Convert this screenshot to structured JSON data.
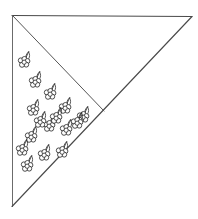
{
  "figure": {
    "caption": "",
    "background_color": "#ffffff",
    "line_color": "#4a4a4a",
    "motif_line_color": "#2e2e2e",
    "canvas": {
      "width": 198,
      "height": 219
    }
  },
  "shapes": {
    "outer_triangle": {
      "name": "outer-triangle",
      "label": "outer triangle outline",
      "points": "12,15 192,16 12,207",
      "vertices": [
        {
          "name": "top-left-corner",
          "x": 12,
          "y": 15
        },
        {
          "name": "top-right-corner",
          "x": 192,
          "y": 16
        },
        {
          "name": "bottom-left-corner",
          "x": 12,
          "y": 207
        }
      ]
    },
    "top_edge": {
      "name": "top-edge",
      "label": "top horizontal edge",
      "x1": 12,
      "y1": 15,
      "x2": 192,
      "y2": 16
    },
    "left_edge": {
      "name": "left-edge",
      "label": "left vertical edge",
      "x1": 12,
      "y1": 15,
      "x2": 12,
      "y2": 207
    },
    "hypotenuse": {
      "name": "hypotenuse-edge",
      "label": "diagonal hypotenuse from top right to bottom left",
      "x1": 192,
      "y1": 16,
      "x2": 12,
      "y2": 207
    },
    "fold_line": {
      "name": "fold-line",
      "label": "interior fold line from top-left corner to hypotenuse",
      "x1": 12,
      "y1": 15,
      "x2": 104,
      "y2": 111
    }
  },
  "motifs": {
    "name": "floral-sprig-motifs",
    "label": "floral sprig cluster motifs",
    "count": 16,
    "petal_radius": 2.5,
    "items": [
      {
        "id": 1,
        "x": 24,
        "y": 62,
        "petals": 5,
        "stem": true
      },
      {
        "id": 2,
        "x": 35,
        "y": 82,
        "petals": 5,
        "stem": true
      },
      {
        "id": 3,
        "x": 50,
        "y": 93,
        "petals": 5,
        "stem": true
      },
      {
        "id": 4,
        "x": 33,
        "y": 110,
        "petals": 5,
        "stem": true
      },
      {
        "id": 5,
        "x": 65,
        "y": 108,
        "petals": 5,
        "stem": true
      },
      {
        "id": 6,
        "x": 82,
        "y": 117,
        "petals": 5,
        "stem": true
      },
      {
        "id": 7,
        "x": 49,
        "y": 126,
        "petals": 5,
        "stem": true
      },
      {
        "id": 8,
        "x": 66,
        "y": 135,
        "petals": 5,
        "stem": true
      },
      {
        "id": 9,
        "x": 31,
        "y": 137,
        "petals": 5,
        "stem": true
      },
      {
        "id": 10,
        "x": 61,
        "y": 134,
        "petals": 5,
        "stem": true
      },
      {
        "id": 11,
        "x": 29,
        "y": 139,
        "petals": 5,
        "stem": true
      },
      {
        "id": 12,
        "x": 47,
        "y": 153,
        "petals": 5,
        "stem": true
      },
      {
        "id": 13,
        "x": 27,
        "y": 165,
        "petals": 5,
        "stem": true
      },
      {
        "id": 14,
        "x": 44,
        "y": 155,
        "petals": 5,
        "stem": true
      },
      {
        "id": 15,
        "x": 60,
        "y": 133,
        "petals": 5,
        "stem": true
      },
      {
        "id": 16,
        "x": 84,
        "y": 116,
        "petals": 5,
        "stem": true
      }
    ],
    "positions": [
      {
        "id": 1,
        "x": 24,
        "y": 62
      },
      {
        "id": 2,
        "x": 35,
        "y": 82
      },
      {
        "id": 3,
        "x": 50,
        "y": 94
      },
      {
        "id": 4,
        "x": 33,
        "y": 110
      },
      {
        "id": 5,
        "x": 65,
        "y": 108
      },
      {
        "id": 6,
        "x": 83,
        "y": 117
      },
      {
        "id": 7,
        "x": 49,
        "y": 126
      },
      {
        "id": 8,
        "x": 66,
        "y": 130
      },
      {
        "id": 9,
        "x": 31,
        "y": 137
      },
      {
        "id": 10,
        "x": 62,
        "y": 152
      },
      {
        "id": 11,
        "x": 44,
        "y": 155
      },
      {
        "id": 12,
        "x": 27,
        "y": 166
      },
      {
        "id": 13,
        "x": 77,
        "y": 123
      },
      {
        "id": 14,
        "x": 56,
        "y": 118
      },
      {
        "id": 15,
        "x": 40,
        "y": 122
      },
      {
        "id": 16,
        "x": 22,
        "y": 150
      }
    ]
  }
}
